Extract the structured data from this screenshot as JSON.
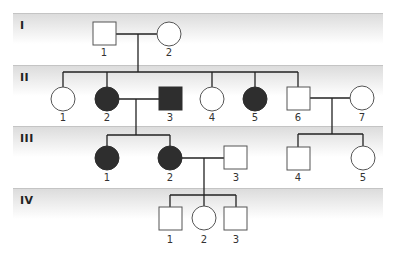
{
  "diagram": {
    "type": "pedigree",
    "colors": {
      "affected_fill": "#2e2e2e",
      "unaffected_fill": "#ffffff",
      "line": "#222222",
      "band": "#dcdcdc"
    },
    "generations": [
      {
        "label": "I",
        "top": 13
      },
      {
        "label": "II",
        "top": 65
      },
      {
        "label": "III",
        "top": 126
      },
      {
        "label": "IV",
        "top": 188
      }
    ],
    "individuals": [
      {
        "id": "I-1",
        "gen": "I",
        "num": "1",
        "sex": "male",
        "affected": false,
        "cx": 104,
        "cy": 34
      },
      {
        "id": "I-2",
        "gen": "I",
        "num": "2",
        "sex": "female",
        "affected": false,
        "cx": 169,
        "cy": 34
      },
      {
        "id": "II-1",
        "gen": "II",
        "num": "1",
        "sex": "female",
        "affected": false,
        "cx": 63,
        "cy": 99
      },
      {
        "id": "II-2",
        "gen": "II",
        "num": "2",
        "sex": "female",
        "affected": true,
        "cx": 107,
        "cy": 99
      },
      {
        "id": "II-3",
        "gen": "II",
        "num": "3",
        "sex": "male",
        "affected": true,
        "cx": 170,
        "cy": 99
      },
      {
        "id": "II-4",
        "gen": "II",
        "num": "4",
        "sex": "female",
        "affected": false,
        "cx": 212,
        "cy": 99
      },
      {
        "id": "II-5",
        "gen": "II",
        "num": "5",
        "sex": "female",
        "affected": true,
        "cx": 255,
        "cy": 99
      },
      {
        "id": "II-6",
        "gen": "II",
        "num": "6",
        "sex": "male",
        "affected": false,
        "cx": 298,
        "cy": 99
      },
      {
        "id": "II-7",
        "gen": "II",
        "num": "7",
        "sex": "female",
        "affected": false,
        "cx": 362,
        "cy": 99
      },
      {
        "id": "III-1",
        "gen": "III",
        "num": "1",
        "sex": "female",
        "affected": true,
        "cx": 107,
        "cy": 158
      },
      {
        "id": "III-2",
        "gen": "III",
        "num": "2",
        "sex": "female",
        "affected": true,
        "cx": 170,
        "cy": 158
      },
      {
        "id": "III-3",
        "gen": "III",
        "num": "3",
        "sex": "male",
        "affected": false,
        "cx": 236,
        "cy": 158
      },
      {
        "id": "III-4",
        "gen": "III",
        "num": "4",
        "sex": "male",
        "affected": false,
        "cx": 298,
        "cy": 158
      },
      {
        "id": "III-5",
        "gen": "III",
        "num": "5",
        "sex": "female",
        "affected": false,
        "cx": 363,
        "cy": 158
      },
      {
        "id": "IV-1",
        "gen": "IV",
        "num": "1",
        "sex": "male",
        "affected": false,
        "cx": 170,
        "cy": 218
      },
      {
        "id": "IV-2",
        "gen": "IV",
        "num": "2",
        "sex": "female",
        "affected": false,
        "cx": 204,
        "cy": 218
      },
      {
        "id": "IV-3",
        "gen": "IV",
        "num": "3",
        "sex": "male",
        "affected": false,
        "cx": 236,
        "cy": 218
      }
    ],
    "matings": [
      {
        "partners": [
          "I-1",
          "I-2"
        ],
        "children": [
          "II-1",
          "II-2",
          "II-3",
          "II-4",
          "II-5",
          "II-6"
        ]
      },
      {
        "partners": [
          "II-2",
          "II-3"
        ],
        "children": [
          "III-1",
          "III-2"
        ]
      },
      {
        "partners": [
          "II-6",
          "II-7"
        ],
        "children": [
          "III-4",
          "III-5"
        ]
      },
      {
        "partners": [
          "III-2",
          "III-3"
        ],
        "children": [
          "IV-1",
          "IV-2",
          "IV-3"
        ]
      }
    ]
  }
}
